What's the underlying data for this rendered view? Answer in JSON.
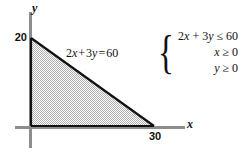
{
  "figure": {
    "type": "linear-programming-feasible-region",
    "axes": {
      "y_axis_name": "y",
      "x_axis_name": "x",
      "y_intercept_label": "20",
      "x_intercept_label": "30"
    },
    "boundary_line": {
      "equation_lhs_coef_x": "2",
      "equation_var_x": "x",
      "equation_plus": "+",
      "equation_lhs_coef_y": "3",
      "equation_var_y": "y",
      "equation_equals": "=",
      "equation_rhs": "60",
      "equation_full": "2x + 3y = 60"
    },
    "system": {
      "brace": "{",
      "constraints": [
        "2x + 3y ≤ 60",
        "x ≥ 0",
        "y ≥ 0"
      ]
    },
    "colors": {
      "axis_gray": "#8d8d8d",
      "boundary_black": "#111111",
      "shade_gray": "#b8b8b8",
      "background": "#ffffff"
    }
  },
  "chart_data": {
    "type": "line",
    "title": "",
    "xlabel": "x",
    "ylabel": "y",
    "xlim": [
      0,
      36
    ],
    "ylim": [
      0,
      24
    ],
    "grid": false,
    "legend": "none",
    "xticks": [
      30
    ],
    "yticks": [
      20
    ],
    "xtick_labels": [
      "30"
    ],
    "ytick_labels": [
      "20"
    ],
    "series": [
      {
        "name": "2x + 3y = 60",
        "x": [
          0,
          30
        ],
        "y": [
          20,
          0
        ]
      }
    ],
    "shaded_region": {
      "label": "feasible region",
      "vertices": [
        [
          0,
          0
        ],
        [
          0,
          20
        ],
        [
          30,
          0
        ]
      ],
      "fill": "#b8b8b8",
      "pattern": "checkerboard-dither"
    },
    "annotations": [
      {
        "text": "2x + 3y = 60",
        "x": 11,
        "y": 15
      },
      {
        "text": "2x + 3y ≤ 60",
        "x": 34,
        "y": 19
      },
      {
        "text": "x ≥ 0",
        "x": 34,
        "y": 16
      },
      {
        "text": "y ≥ 0",
        "x": 34,
        "y": 13
      }
    ]
  }
}
